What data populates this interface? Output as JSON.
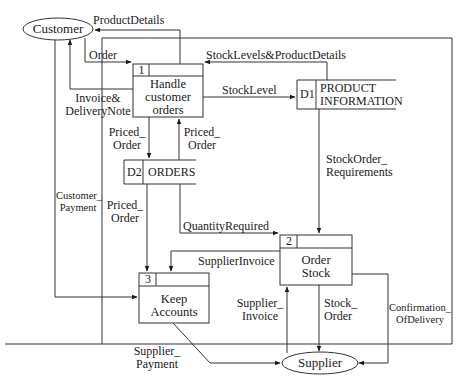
{
  "diagram": {
    "type": "data-flow-diagram",
    "external_entities": [
      {
        "id": "customer",
        "label": "Customer"
      },
      {
        "id": "supplier",
        "label": "Supplier"
      }
    ],
    "processes": [
      {
        "id": "p1",
        "number": "1",
        "label_line1": "Handle",
        "label_line2": "customer",
        "label_line3": "orders"
      },
      {
        "id": "p2",
        "number": "2",
        "label_line1": "Order",
        "label_line2": "Stock"
      },
      {
        "id": "p3",
        "number": "3",
        "label_line1": "Keep",
        "label_line2": "Accounts"
      }
    ],
    "data_stores": [
      {
        "id": "d1",
        "code": "D1",
        "label_line1": "PRODUCT",
        "label_line2": "INFORMATION"
      },
      {
        "id": "d2",
        "code": "D2",
        "label_line1": "ORDERS"
      }
    ],
    "flows": {
      "product_details": "ProductDetails",
      "order": "Order",
      "stock_levels_product_details": "StockLevels&ProductDetails",
      "invoice_delivery_line1": "Invoice&",
      "invoice_delivery_line2": "DeliveryNote",
      "stock_level": "StockLevel",
      "priced_order_a_line1": "Priced_",
      "priced_order_a_line2": "Order",
      "priced_order_b_line1": "Priced_",
      "priced_order_b_line2": "Order",
      "priced_order_c_line1": "Priced_",
      "priced_order_c_line2": "Order",
      "customer_payment_line1": "Customer_",
      "customer_payment_line2": "Payment",
      "stock_order_req_line1": "StockOrder_",
      "stock_order_req_line2": "Requirements",
      "quantity_required": "QuantityRequired",
      "supplier_invoice": "SupplierInvoice",
      "supplier_invoice2_line1": "Supplier_",
      "supplier_invoice2_line2": "Invoice",
      "stock_order_line1": "Stock_",
      "stock_order_line2": "Order",
      "confirmation_line1": "Confirmation_",
      "confirmation_line2": "OfDelivery",
      "supplier_payment_line1": "Supplier_",
      "supplier_payment_line2": "Payment"
    }
  }
}
